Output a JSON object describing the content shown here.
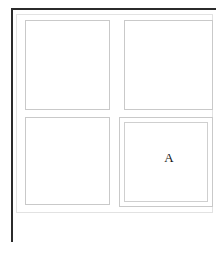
{
  "figure": {
    "background_color": "#ffffff",
    "rule_color": "#2b2b2b",
    "frame_color": "#e2e2e2",
    "cell_border_color": "#c9c9c9",
    "label_color": "#141414"
  },
  "panels": [
    {
      "id": "panel-top-left",
      "label": "",
      "position": "top-left",
      "double_border": false
    },
    {
      "id": "panel-top-right",
      "label": "",
      "position": "top-right",
      "double_border": false
    },
    {
      "id": "panel-bottom-left",
      "label": "",
      "position": "bottom-left",
      "double_border": false
    },
    {
      "id": "panel-bottom-right",
      "label": "A",
      "position": "bottom-right",
      "double_border": true
    }
  ]
}
